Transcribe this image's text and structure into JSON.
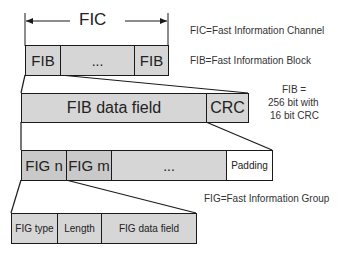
{
  "fic": {
    "title": "FIC",
    "fib_left": "FIB",
    "ellipsis": "...",
    "fib_right": "FIB"
  },
  "fib": {
    "data_field": "FIB data field",
    "crc": "CRC"
  },
  "figs": {
    "fig_n": "FIG n",
    "fig_m": "FIG m",
    "ellipsis": "...",
    "padding": "Padding"
  },
  "fig": {
    "type": "FIG type",
    "length": "Length",
    "data_field": "FIG data field"
  },
  "legend": {
    "fic_def": "FIC=Fast Information Channel",
    "fib_def": "FIB=Fast Information Block",
    "fib_size_line1": "FIB =",
    "fib_size_line2": "256 bit with",
    "fib_size_line3": "16 bit CRC",
    "fig_def": "FIG=Fast Information Group"
  },
  "colors": {
    "box_fill": "#d6d6d6",
    "stroke": "#1a1a1a"
  }
}
